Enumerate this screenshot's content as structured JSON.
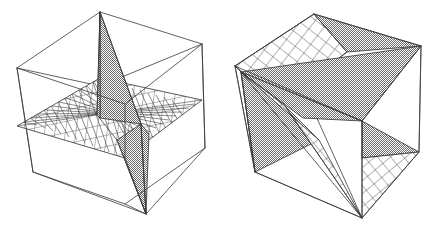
{
  "figure": {
    "background_color": "#ffffff",
    "line_color": "#3a3a3a",
    "shade_color": "#9a9a9a",
    "mesh_color": "#2e2e2e",
    "panels": [
      {
        "id": "panel-left",
        "name": "left-figure",
        "description": "Wireframe cube seen from upper-front-left containing a horizontal grid mesh plane and a near-vertical shaded sheet forming a saddle crossing",
        "view": "front-left elevated",
        "cube": {
          "name": "bounding-cube",
          "vertices_2d": {
            "top_back": [
              100,
              12
            ],
            "top_left": [
              17,
              68
            ],
            "top_right": [
              202,
              44
            ],
            "top_front": [
              125,
              104
            ],
            "bottom_back": [
              100,
              86
            ],
            "bottom_left": [
              33,
              172
            ],
            "bottom_right": [
              205,
              148
            ],
            "bottom_front": [
              146,
              214
            ]
          }
        },
        "surfaces": [
          {
            "name": "grid-mesh-plane",
            "style": "mesh",
            "orientation": "horizontal mid-height plane",
            "grid_divisions": 12
          },
          {
            "name": "shaded-sheet",
            "style": "solid-gray",
            "orientation": "near-vertical ruled sheet",
            "shade": "#9a9a9a"
          }
        ]
      },
      {
        "id": "panel-right",
        "name": "right-figure",
        "description": "Same cube rotated so the shaded sheet and the grid mesh plane both appear strongly foreshortened, producing interleaved fan-shaped wedges",
        "view": "rotated front-left, lower elevation",
        "cube": {
          "name": "bounding-cube",
          "vertices_2d": {
            "top_back": [
              95,
              14
            ],
            "top_left": [
              16,
              66
            ],
            "top_right": [
              202,
              46
            ],
            "top_front": [
              143,
              121
            ],
            "bottom_back": [
              92,
              105
            ],
            "bottom_left": [
              36,
              172
            ],
            "bottom_right": [
              200,
              152
            ],
            "bottom_front": [
              143,
              218
            ]
          }
        },
        "surfaces": [
          {
            "name": "grid-mesh-plane",
            "style": "mesh",
            "orientation": "steeply inclined plane crossing front-lower region",
            "grid_divisions": 12
          },
          {
            "name": "shaded-sheet",
            "style": "solid-gray",
            "orientation": "wedge fan radiating from left vertex",
            "shade": "#9a9a9a"
          }
        ]
      }
    ]
  }
}
